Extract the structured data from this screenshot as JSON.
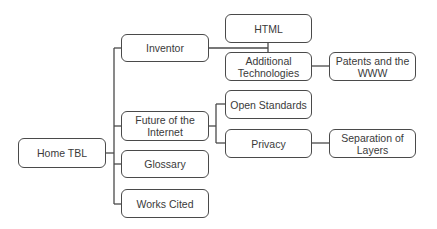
{
  "diagram": {
    "type": "site-map tree",
    "root": {
      "id": "home",
      "label": "Home TBL"
    },
    "nodes": [
      {
        "id": "home",
        "label": "Home TBL",
        "x": 18,
        "y": 138,
        "w": 88,
        "h": 30
      },
      {
        "id": "inventor",
        "label": "Inventor",
        "x": 121,
        "y": 34,
        "w": 88,
        "h": 28
      },
      {
        "id": "future",
        "label": "Future of the Internet",
        "x": 121,
        "y": 111,
        "w": 88,
        "h": 30
      },
      {
        "id": "glossary",
        "label": "Glossary",
        "x": 121,
        "y": 150,
        "w": 88,
        "h": 28
      },
      {
        "id": "works-cited",
        "label": "Works Cited",
        "x": 121,
        "y": 189,
        "w": 88,
        "h": 29
      },
      {
        "id": "html",
        "label": "HTML",
        "x": 225,
        "y": 14,
        "w": 87,
        "h": 29
      },
      {
        "id": "additional-tech",
        "label": "Additional Technologies",
        "x": 225,
        "y": 52,
        "w": 87,
        "h": 29
      },
      {
        "id": "patents",
        "label": "Patents and the WWW",
        "x": 329,
        "y": 52,
        "w": 87,
        "h": 29
      },
      {
        "id": "open-standards",
        "label": "Open Standards",
        "x": 225,
        "y": 90,
        "w": 87,
        "h": 29
      },
      {
        "id": "privacy",
        "label": "Privacy",
        "x": 225,
        "y": 129,
        "w": 87,
        "h": 29
      },
      {
        "id": "separation",
        "label": "Separation of Layers",
        "x": 329,
        "y": 129,
        "w": 87,
        "h": 29
      }
    ],
    "edges": [
      {
        "from": "Home TBL",
        "to": "Inventor"
      },
      {
        "from": "Home TBL",
        "to": "Future of the Internet"
      },
      {
        "from": "Home TBL",
        "to": "Glossary"
      },
      {
        "from": "Home TBL",
        "to": "Works Cited"
      },
      {
        "from": "Inventor",
        "to": "HTML"
      },
      {
        "from": "Inventor",
        "to": "Additional Technologies"
      },
      {
        "from": "Additional Technologies",
        "to": "Patents and the WWW"
      },
      {
        "from": "Future of the Internet",
        "to": "Open Standards"
      },
      {
        "from": "Future of the Internet",
        "to": "Privacy"
      },
      {
        "from": "Privacy",
        "to": "Separation of Layers"
      }
    ],
    "colors": {
      "stroke": "#4a4a4a",
      "text": "#3a3a3a",
      "background": "#ffffff"
    }
  }
}
